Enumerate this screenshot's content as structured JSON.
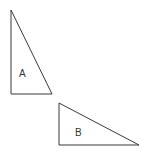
{
  "diagram": {
    "triangles": [
      {
        "label": "A",
        "points": "11,10 11,94 52,94",
        "label_pos": {
          "x": 19,
          "y": 77
        }
      },
      {
        "label": "B",
        "points": "59,103 59,145 139,145",
        "label_pos": {
          "x": 75,
          "y": 136
        }
      }
    ],
    "stroke_color": "#3a3a3a"
  }
}
